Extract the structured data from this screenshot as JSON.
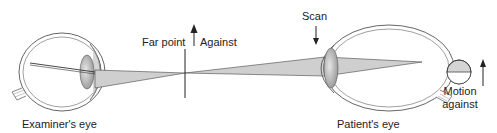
{
  "diagram": {
    "type": "retinoscopy-ray-diagram",
    "labels": {
      "examiner_eye": "Examiner's eye",
      "patient_eye": "Patient's eye",
      "far_point": "Far point",
      "against": "Against",
      "scan": "Scan",
      "motion_line1": "Motion",
      "motion_line2": "against"
    },
    "colors": {
      "line": "#333333",
      "outline": "#555555",
      "beam_fill": "#c8c8c8",
      "lens_fill": "#b0b0b0",
      "background": "#ffffff"
    }
  }
}
